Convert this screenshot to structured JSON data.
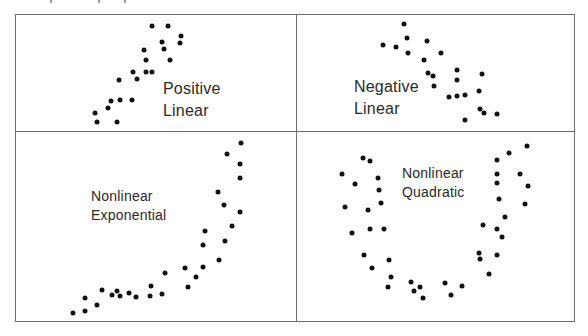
{
  "figure": {
    "dot_color": "#111111",
    "border_color": "#6e6e6e",
    "panels": [
      {
        "id": "positive-linear",
        "label_lines": [
          "Positive",
          "Linear"
        ],
        "label_pos": [
          163,
          78
        ],
        "label_size": "large",
        "points": [
          [
            152,
            26
          ],
          [
            168,
            26
          ],
          [
            181,
            36
          ],
          [
            180,
            43
          ],
          [
            162,
            42
          ],
          [
            164,
            49
          ],
          [
            144,
            50
          ],
          [
            146,
            60
          ],
          [
            170,
            60
          ],
          [
            133,
            72
          ],
          [
            146,
            72
          ],
          [
            152,
            72
          ],
          [
            119,
            80
          ],
          [
            137,
            79
          ],
          [
            120,
            100
          ],
          [
            111,
            101
          ],
          [
            132,
            100
          ],
          [
            108,
            108
          ],
          [
            95,
            113
          ],
          [
            97,
            122
          ],
          [
            117,
            122
          ]
        ]
      },
      {
        "id": "negative-linear",
        "label_lines": [
          "Negative",
          "Linear"
        ],
        "label_pos": [
          354,
          76
        ],
        "label_size": "large",
        "points": [
          [
            404,
            24
          ],
          [
            407,
            38
          ],
          [
            427,
            41
          ],
          [
            383,
            45
          ],
          [
            396,
            47
          ],
          [
            408,
            53
          ],
          [
            441,
            53
          ],
          [
            424,
            60
          ],
          [
            428,
            73
          ],
          [
            433,
            76
          ],
          [
            457,
            70
          ],
          [
            457,
            80
          ],
          [
            482,
            74
          ],
          [
            434,
            86
          ],
          [
            449,
            97
          ],
          [
            457,
            96
          ],
          [
            465,
            95
          ],
          [
            479,
            91
          ],
          [
            480,
            109
          ],
          [
            484,
            113
          ],
          [
            497,
            114
          ],
          [
            465,
            120
          ]
        ]
      },
      {
        "id": "nonlinear-exponential",
        "label_lines": [
          "Nonlinear",
          "Exponential"
        ],
        "label_pos": [
          91,
          187
        ],
        "label_size": "small",
        "points": [
          [
            241,
            143
          ],
          [
            227,
            154
          ],
          [
            240,
            164
          ],
          [
            240,
            178
          ],
          [
            218,
            192
          ],
          [
            224,
            205
          ],
          [
            240,
            212
          ],
          [
            232,
            226
          ],
          [
            205,
            231
          ],
          [
            203,
            245
          ],
          [
            225,
            241
          ],
          [
            219,
            260
          ],
          [
            203,
            267
          ],
          [
            196,
            277
          ],
          [
            185,
            268
          ],
          [
            188,
            287
          ],
          [
            165,
            273
          ],
          [
            162,
            294
          ],
          [
            151,
            286
          ],
          [
            150,
            296
          ],
          [
            136,
            297
          ],
          [
            129,
            293
          ],
          [
            120,
            296
          ],
          [
            117,
            291
          ],
          [
            112,
            295
          ],
          [
            102,
            290
          ],
          [
            97,
            305
          ],
          [
            85,
            298
          ],
          [
            85,
            311
          ],
          [
            73,
            313
          ]
        ]
      },
      {
        "id": "nonlinear-quadratic",
        "label_lines": [
          "Nonlinear",
          "Quadratic"
        ],
        "label_pos": [
          402,
          164
        ],
        "label_size": "small",
        "points": [
          [
            363,
            158
          ],
          [
            370,
            161
          ],
          [
            342,
            174
          ],
          [
            378,
            178
          ],
          [
            355,
            184
          ],
          [
            379,
            190
          ],
          [
            345,
            207
          ],
          [
            381,
            203
          ],
          [
            368,
            210
          ],
          [
            352,
            233
          ],
          [
            370,
            229
          ],
          [
            384,
            229
          ],
          [
            364,
            255
          ],
          [
            389,
            260
          ],
          [
            372,
            268
          ],
          [
            391,
            277
          ],
          [
            388,
            287
          ],
          [
            411,
            282
          ],
          [
            414,
            291
          ],
          [
            420,
            287
          ],
          [
            423,
            298
          ],
          [
            445,
            283
          ],
          [
            462,
            286
          ],
          [
            451,
            295
          ],
          [
            527,
            146
          ],
          [
            509,
            153
          ],
          [
            497,
            160
          ],
          [
            497,
            174
          ],
          [
            520,
            174
          ],
          [
            497,
            183
          ],
          [
            528,
            186
          ],
          [
            499,
            199
          ],
          [
            525,
            204
          ],
          [
            505,
            217
          ],
          [
            483,
            225
          ],
          [
            497,
            229
          ],
          [
            502,
            237
          ],
          [
            479,
            253
          ],
          [
            480,
            259
          ],
          [
            497,
            255
          ],
          [
            489,
            274
          ]
        ]
      }
    ]
  }
}
